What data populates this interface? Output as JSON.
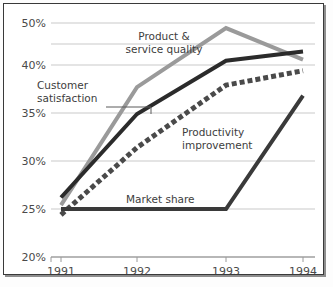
{
  "chart_data": {
    "type": "line",
    "title": "",
    "xlabel": "",
    "ylabel": "",
    "x": [
      "1991",
      "1992",
      "1993",
      "1994"
    ],
    "categories": [
      "1991",
      "1992",
      "1993",
      "1994"
    ],
    "yticks": [
      "20%",
      "25%",
      "30%",
      "35%",
      "40%",
      "50%"
    ],
    "ytick_values": [
      20,
      25,
      30,
      35,
      40,
      50
    ],
    "ylim": [
      20,
      50
    ],
    "grid": true,
    "legend_position": "inline-annotations",
    "series": [
      {
        "name": "Product & service quality",
        "label": "Product &\nservice quality",
        "color": "#9a9a9a",
        "style": "solid",
        "values": [
          25.4,
          37.7,
          48.8,
          41.3
        ]
      },
      {
        "name": "Customer satisfaction",
        "label": "Customer\nsatisfaction",
        "color": "#2b2b2b",
        "style": "solid",
        "values": [
          26.2,
          34.9,
          41.0,
          43.2
        ]
      },
      {
        "name": "Productivity improvement",
        "label": "Productivity\nimprovement",
        "color": "#4a4a4a",
        "style": "dotted",
        "values": [
          24.4,
          31.4,
          37.9,
          39.4
        ]
      },
      {
        "name": "Market share",
        "label": "Market share",
        "color": "#3a3a3a",
        "style": "solid",
        "values": [
          25.0,
          25.0,
          25.0,
          36.8
        ]
      }
    ],
    "annotations": [
      {
        "name": "product-service-quality",
        "text_line1": "Product &",
        "text_line2": "service quality",
        "x": 160,
        "y": 36,
        "anchor": "middle",
        "leader": null
      },
      {
        "name": "customer-satisfaction",
        "text_line1": "Customer",
        "text_line2": "satisfaction",
        "x": 33,
        "y": 85,
        "anchor": "start",
        "leader": "M 102,103 L 147,103 L 147,110"
      },
      {
        "name": "productivity-improvement",
        "text_line1": "Productivity",
        "text_line2": "improvement",
        "x": 178,
        "y": 132,
        "anchor": "start",
        "leader": null
      },
      {
        "name": "market-share",
        "text_line1": "Market share",
        "text_line2": "",
        "x": 122,
        "y": 199,
        "anchor": "start",
        "leader": null
      }
    ]
  },
  "page": {
    "caption": ""
  }
}
